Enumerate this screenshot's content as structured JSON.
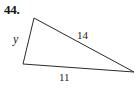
{
  "figure": {
    "problem_number": "44.",
    "shape": "triangle",
    "background_color": "#ffffff",
    "stroke_color": "#2b2b2b",
    "labels": {
      "left_side": "y",
      "hypotenuse": "14",
      "base": "11"
    },
    "geometry": {
      "vertices": {
        "top": [
          34,
          18
        ],
        "bottom_left": [
          23,
          64
        ],
        "right": [
          134,
          72
        ]
      },
      "points_attr": "34,18 23,64 134,72"
    }
  }
}
